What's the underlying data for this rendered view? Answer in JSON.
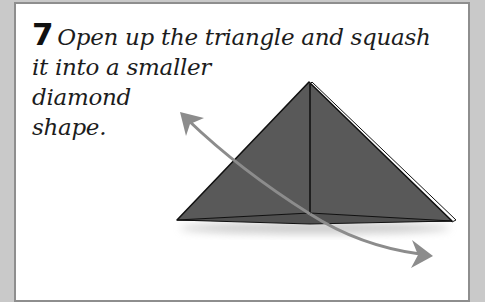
{
  "instruction": {
    "step_number": "7",
    "lines": [
      "Open up the triangle and squash",
      "it into a smaller",
      "diamond",
      "shape."
    ]
  },
  "illustration": {
    "subject": "folded paper triangle",
    "paper_color": "#585858",
    "arrow_color": "#8c8c8c",
    "arrows": [
      "curved-arrow-up-left",
      "curved-arrow-down-right"
    ]
  },
  "colors": {
    "background": "#c9c9c9",
    "panel": "#ffffff",
    "border": "#8e8e8e",
    "text": "#1c1c1c"
  }
}
